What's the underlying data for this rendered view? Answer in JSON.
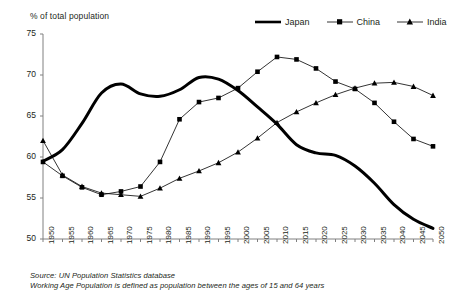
{
  "chart_data": {
    "type": "line",
    "title": "",
    "ylabel": "% of total population",
    "xlabel": "",
    "ylim": [
      50,
      75
    ],
    "yticks": [
      50,
      55,
      60,
      65,
      70,
      75
    ],
    "grid": false,
    "legend_position": "top-right",
    "x": [
      1950,
      1955,
      1960,
      1965,
      1970,
      1975,
      1980,
      1985,
      1990,
      1995,
      2000,
      2005,
      2010,
      2015,
      2020,
      2025,
      2030,
      2035,
      2040,
      2045,
      2050
    ],
    "series": [
      {
        "name": "Japan",
        "style": "thick-solid-no-marker",
        "color": "#000000",
        "values": [
          59.5,
          60.9,
          64.1,
          67.8,
          68.9,
          67.7,
          67.4,
          68.2,
          69.7,
          69.5,
          68.1,
          66.1,
          64.0,
          61.5,
          60.5,
          60.2,
          58.9,
          56.8,
          54.2,
          52.4,
          51.3
        ]
      },
      {
        "name": "China",
        "style": "thin-solid-square-marker",
        "color": "#000000",
        "values": [
          59.4,
          57.7,
          56.3,
          55.4,
          55.8,
          56.4,
          59.4,
          64.6,
          66.7,
          67.2,
          68.4,
          70.4,
          72.2,
          71.9,
          70.8,
          69.2,
          68.3,
          66.6,
          64.3,
          62.2,
          61.3
        ]
      },
      {
        "name": "India",
        "style": "thin-solid-triangle-marker",
        "color": "#000000",
        "values": [
          62.0,
          57.8,
          56.4,
          55.6,
          55.4,
          55.2,
          56.2,
          57.4,
          58.3,
          59.3,
          60.6,
          62.3,
          64.2,
          65.5,
          66.6,
          67.6,
          68.4,
          69.0,
          69.1,
          68.6,
          67.5
        ]
      }
    ],
    "xticklabels": [
      "1950",
      "1955",
      "1960",
      "1965",
      "1970",
      "1975",
      "1980",
      "1985",
      "1990",
      "1995",
      "2000",
      "2005",
      "2010",
      "2015",
      "2020",
      "2025",
      "2030",
      "2035",
      "2040",
      "2045",
      "2050"
    ],
    "annotations": [
      "Source: UN Population Statistics database",
      "Working Age Population is defined as population between the ages of 15 and 64 years"
    ]
  },
  "legend": {
    "items": [
      {
        "label": "Japan",
        "marker": "none"
      },
      {
        "label": "China",
        "marker": "square"
      },
      {
        "label": "India",
        "marker": "triangle"
      }
    ]
  },
  "footnotes": {
    "source": "Source: UN Population Statistics database",
    "definition": "Working Age Population is defined as population between the ages of 15 and 64 years"
  }
}
